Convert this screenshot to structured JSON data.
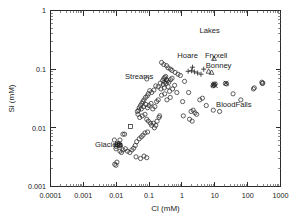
{
  "chart_data": {
    "type": "scatter",
    "title": "",
    "xlabel": "Cl (mM)",
    "ylabel": "Si (mM)",
    "xscale": "log",
    "yscale": "log",
    "xlim": [
      0.0001,
      1000
    ],
    "ylim": [
      0.001,
      1
    ],
    "xticks": [
      "0.0001",
      "0.001",
      "0.01",
      "0.1",
      "1",
      "10",
      "100",
      "1000"
    ],
    "yticks": [
      "0.001",
      "0.01",
      "0.1",
      "1"
    ],
    "grid": false,
    "legend_position": "none",
    "annotations": [
      {
        "text": "Lakes",
        "x": 7.0,
        "y": 0.42
      },
      {
        "text": "Hoare",
        "x": 1.5,
        "y": 0.155
      },
      {
        "text": "Fryxell",
        "x": 11.0,
        "y": 0.155
      },
      {
        "text": "Bonney",
        "x": 13.0,
        "y": 0.105
      },
      {
        "text": "Streams",
        "x": 0.05,
        "y": 0.068
      },
      {
        "text": "Glaciers",
        "x": 0.006,
        "y": 0.0048
      },
      {
        "text": "BloodFalls",
        "x": 38.0,
        "y": 0.023
      }
    ],
    "series": [
      {
        "name": "Streams",
        "marker": "circle",
        "points": [
          [
            0.085,
            0.068
          ],
          [
            0.3,
            0.072
          ],
          [
            0.28,
            0.069
          ],
          [
            0.32,
            0.075
          ],
          [
            0.26,
            0.064
          ],
          [
            0.34,
            0.066
          ],
          [
            0.3,
            0.06
          ],
          [
            0.36,
            0.063
          ],
          [
            0.22,
            0.058
          ],
          [
            0.27,
            0.055
          ],
          [
            0.33,
            0.057
          ],
          [
            0.4,
            0.06
          ],
          [
            0.45,
            0.066
          ],
          [
            0.5,
            0.07
          ],
          [
            0.38,
            0.05
          ],
          [
            0.29,
            0.048
          ],
          [
            0.23,
            0.046
          ],
          [
            0.19,
            0.05
          ],
          [
            0.16,
            0.052
          ],
          [
            0.14,
            0.044
          ],
          [
            0.12,
            0.04
          ],
          [
            0.105,
            0.043
          ],
          [
            0.095,
            0.038
          ],
          [
            0.088,
            0.035
          ],
          [
            0.078,
            0.033
          ],
          [
            0.07,
            0.03
          ],
          [
            0.065,
            0.028
          ],
          [
            0.06,
            0.026
          ],
          [
            0.055,
            0.024
          ],
          [
            0.05,
            0.022
          ],
          [
            0.048,
            0.02
          ],
          [
            0.058,
            0.021
          ],
          [
            0.068,
            0.023
          ],
          [
            0.08,
            0.025
          ],
          [
            0.09,
            0.022
          ],
          [
            0.1,
            0.024
          ],
          [
            0.115,
            0.026
          ],
          [
            0.13,
            0.021
          ],
          [
            0.15,
            0.023
          ],
          [
            0.17,
            0.028
          ],
          [
            0.19,
            0.03
          ],
          [
            0.075,
            0.017
          ],
          [
            0.062,
            0.016
          ],
          [
            0.052,
            0.015
          ],
          [
            0.046,
            0.017
          ],
          [
            0.044,
            0.019
          ],
          [
            0.085,
            0.014
          ],
          [
            0.095,
            0.013
          ],
          [
            0.11,
            0.012
          ],
          [
            0.12,
            0.011
          ],
          [
            0.135,
            0.012
          ],
          [
            0.145,
            0.01
          ],
          [
            0.16,
            0.011
          ],
          [
            0.175,
            0.013
          ],
          [
            0.2,
            0.015
          ],
          [
            0.21,
            0.016
          ],
          [
            0.09,
            0.0085
          ],
          [
            0.075,
            0.0082
          ],
          [
            0.065,
            0.0075
          ],
          [
            0.058,
            0.007
          ],
          [
            0.05,
            0.0065
          ],
          [
            0.042,
            0.0058
          ],
          [
            0.038,
            0.005
          ],
          [
            0.034,
            0.0045
          ],
          [
            0.03,
            0.0042
          ],
          [
            0.026,
            0.0038
          ],
          [
            0.04,
            0.0032
          ],
          [
            0.055,
            0.003
          ],
          [
            0.07,
            0.0033
          ],
          [
            0.085,
            0.0031
          ],
          [
            0.022,
            0.004
          ],
          [
            0.019,
            0.0044
          ],
          [
            0.016,
            0.0078
          ],
          [
            0.013,
            0.0062
          ],
          [
            0.24,
            0.036
          ],
          [
            0.3,
            0.038
          ],
          [
            0.42,
            0.042
          ],
          [
            0.52,
            0.046
          ],
          [
            0.6,
            0.053
          ],
          [
            0.7,
            0.04
          ],
          [
            0.44,
            0.033
          ],
          [
            0.35,
            0.03
          ],
          [
            0.28,
            0.12
          ],
          [
            0.34,
            0.115
          ],
          [
            0.38,
            0.105
          ],
          [
            0.45,
            0.1
          ],
          [
            0.5,
            0.095
          ],
          [
            0.24,
            0.13
          ],
          [
            0.62,
            0.088
          ],
          [
            0.76,
            0.082
          ],
          [
            0.9,
            0.078
          ]
        ]
      },
      {
        "name": "Glaciers",
        "marker": "circle",
        "points": [
          [
            0.0105,
            0.0052
          ],
          [
            0.0115,
            0.005
          ],
          [
            0.01,
            0.0048
          ],
          [
            0.012,
            0.0054
          ],
          [
            0.0098,
            0.0044
          ],
          [
            0.013,
            0.004
          ],
          [
            0.0145,
            0.0038
          ],
          [
            0.0088,
            0.0062
          ],
          [
            0.009,
            0.0024
          ],
          [
            0.0098,
            0.0023
          ],
          [
            0.0105,
            0.0026
          ],
          [
            0.018,
            0.0078
          ],
          [
            0.016,
            0.0042
          ],
          [
            0.0135,
            0.005
          ]
        ]
      },
      {
        "name": "Glaciers-square",
        "marker": "square",
        "points": [
          [
            0.011,
            0.0053
          ],
          [
            0.0125,
            0.0051
          ],
          [
            0.027,
            0.0105
          ]
        ]
      },
      {
        "name": "Hoare",
        "marker": "plus",
        "points": [
          [
            1.55,
            0.092
          ],
          [
            1.95,
            0.094
          ],
          [
            2.4,
            0.09
          ],
          [
            3.0,
            0.086
          ],
          [
            3.8,
            0.082
          ],
          [
            4.6,
            0.1
          ],
          [
            2.1,
            0.108
          ]
        ]
      },
      {
        "name": "Fryxell",
        "marker": "triangle",
        "points": [
          [
            9.5,
            0.152
          ],
          [
            6.5,
            0.092
          ],
          [
            8.0,
            0.088
          ]
        ]
      },
      {
        "name": "Bonney",
        "marker": "cross",
        "points": [
          [
            9.0,
            0.054
          ],
          [
            9.8,
            0.056
          ],
          [
            10.5,
            0.052
          ],
          [
            22.0,
            0.058
          ]
        ]
      },
      {
        "name": "Lakes-other",
        "marker": "circle",
        "points": [
          [
            1.2,
            0.062
          ],
          [
            1.6,
            0.04
          ],
          [
            1.9,
            0.019
          ],
          [
            2.2,
            0.02
          ],
          [
            2.5,
            0.018
          ],
          [
            2.8,
            0.017
          ],
          [
            2.05,
            0.013
          ],
          [
            1.7,
            0.014
          ],
          [
            3.5,
            0.03
          ],
          [
            4.2,
            0.032
          ],
          [
            5.5,
            0.024
          ],
          [
            1.1,
            0.016
          ],
          [
            9.2,
            0.055
          ],
          [
            9.6,
            0.053
          ],
          [
            10.2,
            0.056
          ],
          [
            8.8,
            0.052
          ],
          [
            21.0,
            0.057
          ],
          [
            23.0,
            0.056
          ],
          [
            36.0,
            0.038
          ],
          [
            62.0,
            0.03
          ],
          [
            150.0,
            0.046
          ],
          [
            160.0,
            0.048
          ],
          [
            270.0,
            0.06
          ],
          [
            290.0,
            0.058
          ],
          [
            280.0,
            0.057
          ],
          [
            9.0,
            0.02
          ],
          [
            14.0,
            0.019
          ],
          [
            1.05,
            0.028
          ]
        ]
      }
    ]
  },
  "axes": {
    "x_title": "Cl (mM)",
    "y_title": "Si (mM)"
  }
}
